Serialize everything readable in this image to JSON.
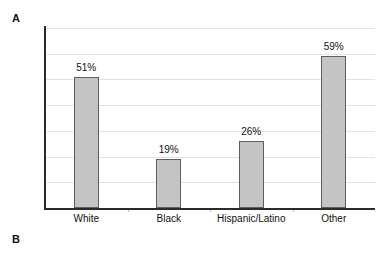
{
  "panels": {
    "a_label": "A",
    "b_label": "B"
  },
  "chart_data": {
    "type": "bar",
    "title": "",
    "xlabel": "",
    "ylabel": "",
    "categories": [
      "White",
      "Black",
      "Hispanic/Latino",
      "Other"
    ],
    "values": [
      51,
      19,
      26,
      59
    ],
    "value_labels": [
      "51%",
      "19%",
      "26%",
      "59%"
    ],
    "ylim": [
      0,
      70
    ],
    "grid": true,
    "gridline_values": [
      70,
      60,
      50,
      40,
      30,
      20,
      10
    ],
    "legend": "none",
    "axis_tick_labels": [],
    "bar_color": "#c4c4c4",
    "bar_border_color": "#5e5e5e",
    "gridline_color": "#e3e3e3",
    "axis_color": "#2b2b2b"
  }
}
